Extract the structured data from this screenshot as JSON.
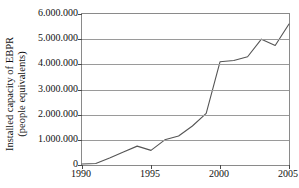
{
  "chart_data": {
    "type": "line",
    "title": "",
    "xlabel": "",
    "ylabel": "Installed capacity of EBPR (people equivalents)",
    "ylabel_lines": [
      "Installed capacity of EBPR",
      "(people equivalents)"
    ],
    "xlim": [
      1990,
      2005
    ],
    "ylim": [
      0,
      6000000
    ],
    "grid": true,
    "legend": null,
    "x_tick_labels": [
      "1990",
      "1995",
      "2000",
      "2005"
    ],
    "x_tick_values": [
      1990,
      1995,
      2000,
      2005
    ],
    "y_tick_labels": [
      "0",
      "1.000.000",
      "2.000.000",
      "3.000.000",
      "4.000.000",
      "5.000.000",
      "6.000.000"
    ],
    "y_tick_values": [
      0,
      1000000,
      2000000,
      3000000,
      4000000,
      5000000,
      6000000
    ],
    "line_color": "#555555",
    "x": [
      1990,
      1991,
      1992,
      1993,
      1994,
      1995,
      1996,
      1997,
      1998,
      1999,
      2000,
      2001,
      2002,
      2003,
      2004,
      2005
    ],
    "values": [
      40000,
      60000,
      280000,
      520000,
      750000,
      580000,
      1000000,
      1150000,
      1550000,
      2050000,
      4100000,
      4150000,
      4300000,
      5000000,
      4750000,
      5600000
    ],
    "series": [
      {
        "name": "Installed capacity of EBPR",
        "values": [
          40000,
          60000,
          280000,
          520000,
          750000,
          580000,
          1000000,
          1150000,
          1550000,
          2050000,
          4100000,
          4150000,
          4300000,
          5000000,
          4750000,
          5600000
        ]
      }
    ]
  }
}
